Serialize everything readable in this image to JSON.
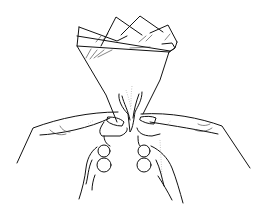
{
  "illustration": {
    "subject": "Two hands pinching the base of a folded fan-shaped napkin",
    "style": "black line art on white background",
    "colors": {
      "background": "#ffffff",
      "line": "#111111"
    },
    "elements": {
      "napkin": "folded cone with layered pointed peaks at top",
      "left_hand": "left hand pinching from the left, knuckles visible",
      "right_hand": "right hand pinching from the right, knuckles visible"
    }
  }
}
